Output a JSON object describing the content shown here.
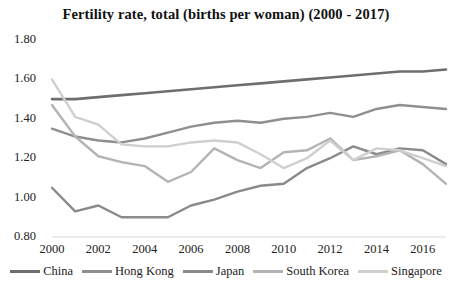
{
  "chart_data": {
    "type": "line",
    "title": "Fertility rate, total (births per woman) (2000 - 2017)",
    "xlabel": "",
    "ylabel": "",
    "x": [
      2000,
      2001,
      2002,
      2003,
      2004,
      2005,
      2006,
      2007,
      2008,
      2009,
      2010,
      2011,
      2012,
      2013,
      2014,
      2015,
      2016,
      2017
    ],
    "xtick_labels": [
      "2000",
      "2002",
      "2004",
      "2006",
      "2008",
      "2010",
      "2012",
      "2014",
      "2016"
    ],
    "xticks": [
      2000,
      2002,
      2004,
      2006,
      2008,
      2010,
      2012,
      2014,
      2016
    ],
    "xlim": [
      2000,
      2017
    ],
    "ytick_labels": [
      "0.80",
      "1.00",
      "1.20",
      "1.40",
      "1.60",
      "1.80"
    ],
    "yticks": [
      0.8,
      1.0,
      1.2,
      1.4,
      1.6,
      1.8
    ],
    "ylim": [
      0.8,
      1.8
    ],
    "grid": false,
    "legend_position": "bottom",
    "series": [
      {
        "name": "China",
        "color": "#6e6e6e",
        "width": 2.6,
        "values": [
          1.5,
          1.5,
          1.51,
          1.52,
          1.53,
          1.54,
          1.55,
          1.56,
          1.57,
          1.58,
          1.59,
          1.6,
          1.61,
          1.62,
          1.63,
          1.64,
          1.64,
          1.65
        ]
      },
      {
        "name": "Hong Kong",
        "color": "#8f8f8f",
        "width": 2.4,
        "values": [
          1.35,
          1.31,
          1.29,
          1.28,
          1.3,
          1.33,
          1.36,
          1.38,
          1.39,
          1.38,
          1.4,
          1.41,
          1.43,
          1.41,
          1.45,
          1.47,
          1.46,
          1.45
        ]
      },
      {
        "name": "Japan",
        "color": "#8a8a8a",
        "width": 2.4,
        "values": [
          1.05,
          0.93,
          0.96,
          0.9,
          0.9,
          0.9,
          0.96,
          0.99,
          1.03,
          1.06,
          1.07,
          1.15,
          1.2,
          1.26,
          1.22,
          1.25,
          1.24,
          1.17
        ]
      },
      {
        "name": "South Korea",
        "color": "#b4b4b4",
        "width": 2.4,
        "values": [
          1.47,
          1.31,
          1.21,
          1.18,
          1.16,
          1.08,
          1.13,
          1.25,
          1.19,
          1.15,
          1.23,
          1.24,
          1.3,
          1.19,
          1.21,
          1.24,
          1.17,
          1.07
        ]
      },
      {
        "name": "Singapore",
        "color": "#cfcfcf",
        "width": 2.4,
        "values": [
          1.6,
          1.41,
          1.37,
          1.27,
          1.26,
          1.26,
          1.28,
          1.29,
          1.28,
          1.22,
          1.15,
          1.2,
          1.29,
          1.19,
          1.25,
          1.24,
          1.2,
          1.16
        ]
      }
    ]
  },
  "axis": {
    "y_labels": [
      "1.80",
      "1.60",
      "1.40",
      "1.20",
      "1.00",
      "0.80"
    ],
    "x_labels": [
      "2000",
      "2002",
      "2004",
      "2006",
      "2008",
      "2010",
      "2012",
      "2014",
      "2016"
    ]
  },
  "legend": {
    "items": [
      {
        "label": "China",
        "color": "#6e6e6e"
      },
      {
        "label": "Hong Kong",
        "color": "#8f8f8f"
      },
      {
        "label": "Japan",
        "color": "#8a8a8a"
      },
      {
        "label": "South Korea",
        "color": "#b4b4b4"
      },
      {
        "label": "Singapore",
        "color": "#cfcfcf"
      }
    ]
  }
}
